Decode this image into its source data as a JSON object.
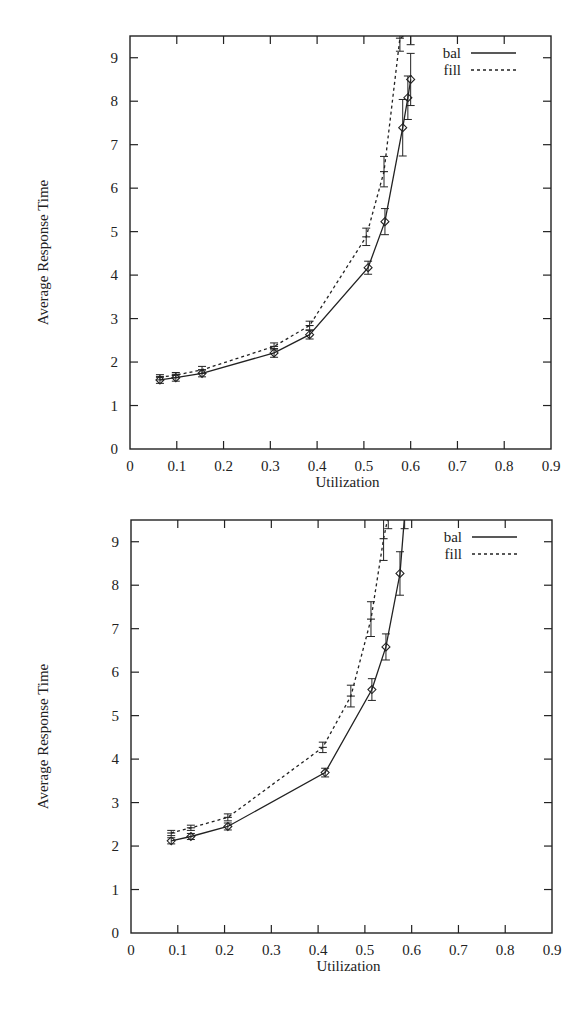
{
  "chart_data": [
    {
      "type": "line",
      "title": "",
      "xlabel": "Utilization",
      "ylabel": "Average Response Time",
      "xlim": [
        0,
        0.9
      ],
      "ylim": [
        0,
        9.5
      ],
      "xticks": [
        "0",
        "0.1",
        "0.2",
        "0.3",
        "0.4",
        "0.5",
        "0.6",
        "0.7",
        "0.8",
        "0.9"
      ],
      "yticks": [
        "0",
        "1",
        "2",
        "3",
        "4",
        "5",
        "6",
        "7",
        "8",
        "9"
      ],
      "grid": false,
      "legend_position": "top-right",
      "series": [
        {
          "name": "bal",
          "style": "solid",
          "marker": "diamond",
          "x": [
            0.064,
            0.098,
            0.154,
            0.308,
            0.384,
            0.509,
            0.545,
            0.583,
            0.594,
            0.6
          ],
          "y": [
            1.59,
            1.64,
            1.74,
            2.21,
            2.63,
            4.17,
            5.23,
            7.39,
            8.08,
            8.5
          ],
          "err": [
            0.08,
            0.08,
            0.08,
            0.1,
            0.1,
            0.15,
            0.3,
            0.65,
            0.5,
            0.6
          ]
        },
        {
          "name": "fill",
          "style": "dashed",
          "marker": "plus",
          "x": [
            0.064,
            0.098,
            0.154,
            0.308,
            0.384,
            0.505,
            0.543,
            0.577,
            0.6
          ],
          "y": [
            1.65,
            1.7,
            1.82,
            2.36,
            2.84,
            4.88,
            6.38,
            9.45,
            9.6
          ],
          "err": [
            0.06,
            0.06,
            0.08,
            0.08,
            0.1,
            0.2,
            0.35,
            0.3,
            0.3
          ]
        }
      ]
    },
    {
      "type": "line",
      "title": "",
      "xlabel": "Utilization",
      "ylabel": "Average Response Time",
      "xlim": [
        0,
        0.9
      ],
      "ylim": [
        0,
        9.5
      ],
      "xticks": [
        "0",
        "0.1",
        "0.2",
        "0.3",
        "0.4",
        "0.5",
        "0.6",
        "0.7",
        "0.8",
        "0.9"
      ],
      "yticks": [
        "0",
        "1",
        "2",
        "3",
        "4",
        "5",
        "6",
        "7",
        "8",
        "9"
      ],
      "grid": false,
      "legend_position": "top-right",
      "series": [
        {
          "name": "bal",
          "style": "solid",
          "marker": "diamond",
          "x": [
            0.086,
            0.128,
            0.207,
            0.415,
            0.515,
            0.545,
            0.575,
            0.585
          ],
          "y": [
            2.12,
            2.22,
            2.45,
            3.69,
            5.6,
            6.58,
            8.27,
            9.6
          ],
          "err": [
            0.07,
            0.07,
            0.08,
            0.1,
            0.25,
            0.3,
            0.5,
            0.3
          ]
        },
        {
          "name": "fill",
          "style": "dashed",
          "marker": "plus",
          "x": [
            0.086,
            0.128,
            0.207,
            0.41,
            0.47,
            0.513,
            0.54,
            0.55
          ],
          "y": [
            2.3,
            2.42,
            2.66,
            4.27,
            5.45,
            7.22,
            9.07,
            9.6
          ],
          "err": [
            0.06,
            0.06,
            0.08,
            0.12,
            0.25,
            0.4,
            0.5,
            0.3
          ]
        }
      ]
    }
  ],
  "charts_layout": [
    {
      "top": 0,
      "plot": {
        "left": 130,
        "right": 551,
        "top": 36,
        "bottom": 449
      }
    },
    {
      "top": 484,
      "plot": {
        "left": 131,
        "right": 552,
        "top": 36,
        "bottom": 449
      }
    }
  ]
}
